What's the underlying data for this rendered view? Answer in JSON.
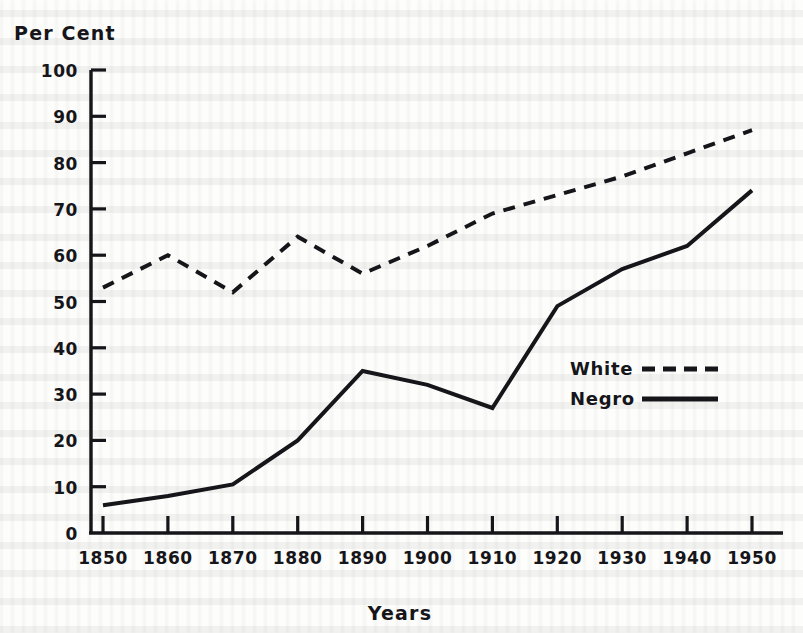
{
  "chart_data": {
    "type": "line",
    "title": "",
    "xlabel": "Years",
    "ylabel": "Per Cent",
    "x": [
      1850,
      1860,
      1870,
      1880,
      1890,
      1900,
      1910,
      1920,
      1930,
      1940,
      1950
    ],
    "xticklabels": [
      "1850",
      "1860",
      "1870",
      "1880",
      "1890",
      "1900",
      "1910",
      "1920",
      "1930",
      "1940",
      "1950"
    ],
    "yticklabels": [
      "0",
      "10",
      "20",
      "30",
      "40",
      "50",
      "60",
      "70",
      "80",
      "90",
      "100"
    ],
    "xlim": [
      1850,
      1950
    ],
    "ylim": [
      0,
      100
    ],
    "grid": false,
    "legend_position": "center-right",
    "series": [
      {
        "name": "White",
        "style": "dashed",
        "color": "#15151a",
        "values": [
          53,
          60,
          52,
          64,
          56,
          62,
          69,
          73,
          77,
          82,
          87
        ]
      },
      {
        "name": "Negro",
        "style": "solid",
        "color": "#15151a",
        "values": [
          6,
          8,
          10.5,
          20,
          35,
          32,
          27,
          49,
          57,
          62,
          74
        ]
      }
    ]
  },
  "axes": {
    "y_axis_title": "Per Cent",
    "x_axis_title": "Years"
  },
  "legend": {
    "entries": [
      {
        "label": "White",
        "style": "dashed"
      },
      {
        "label": "Negro",
        "style": "solid"
      }
    ]
  },
  "colors": {
    "ink": "#15151a",
    "paper": "#fdfdfb"
  }
}
